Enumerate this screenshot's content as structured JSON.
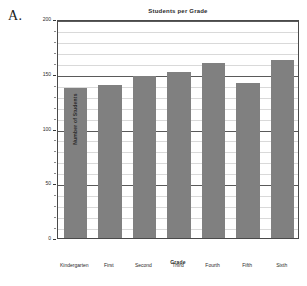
{
  "panel": {
    "letter": "A."
  },
  "chart_data": {
    "type": "bar",
    "title": "Students per Grade",
    "xlabel": "Grade",
    "ylabel": "Number of Students",
    "categories": [
      "Kindergarten",
      "First",
      "Second",
      "Third",
      "Fourth",
      "Fifth",
      "Sixth"
    ],
    "values": [
      137,
      140,
      148,
      152,
      160,
      142,
      163
    ],
    "ylim": [
      0,
      200
    ],
    "yticks": [
      0,
      50,
      100,
      150,
      200
    ],
    "ytick_labels": [
      "0",
      "50",
      "100",
      "150",
      "200"
    ],
    "minor_tick_step": 10,
    "grid": true,
    "legend": "none",
    "bar_color": "#808080",
    "grid_color_major": "#5a5a5a",
    "grid_color_minor": "#d9d9d9",
    "frame_color": "#4a4a4a"
  }
}
